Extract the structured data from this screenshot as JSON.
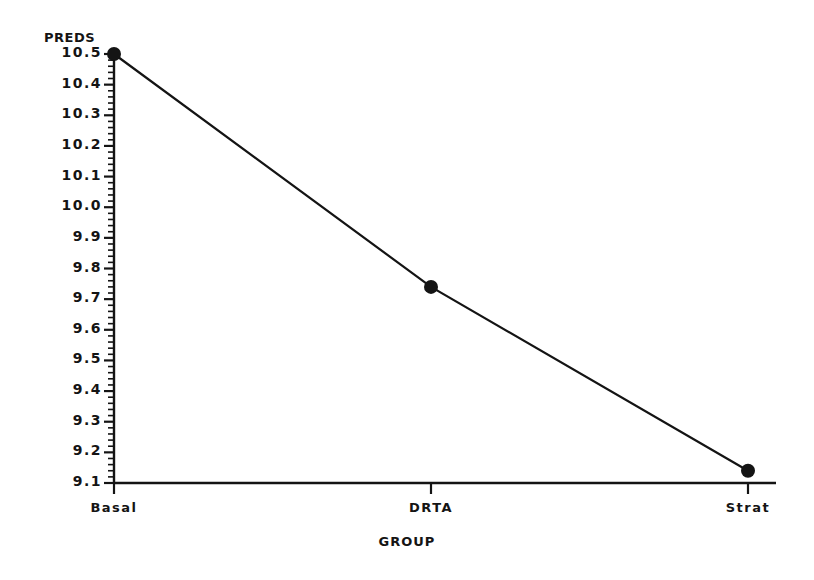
{
  "chart_data": {
    "type": "line",
    "title": "",
    "xlabel": "GROUP",
    "ylabel": "PREDS",
    "categories": [
      "Basal",
      "DRTA",
      "Strat"
    ],
    "values": [
      10.5,
      9.74,
      9.14
    ],
    "series": [
      {
        "name": "PREDS",
        "values": [
          10.5,
          9.74,
          9.14
        ]
      }
    ],
    "ylim": [
      9.1,
      10.5
    ],
    "ytick_labels": [
      "10.5",
      "10.4",
      "10.3",
      "10.2",
      "10.1",
      "10.0",
      "9.9",
      "9.8",
      "9.7",
      "9.6",
      "9.5",
      "9.4",
      "9.3",
      "9.2",
      "9.1"
    ],
    "ytick_values": [
      10.5,
      10.4,
      10.3,
      10.2,
      10.1,
      10.0,
      9.9,
      9.8,
      9.7,
      9.6,
      9.5,
      9.4,
      9.3,
      9.2,
      9.1
    ],
    "ytick_major_step": 0.1,
    "ytick_minor_step": 0.02,
    "grid": false,
    "legend": "none",
    "marker": "filled-circle",
    "line_color": "#141414",
    "marker_color": "#141414",
    "axis_color": "#141414",
    "background_color": "#ffffff"
  },
  "axes": {
    "y_title": "PREDS",
    "x_title": "GROUP"
  }
}
